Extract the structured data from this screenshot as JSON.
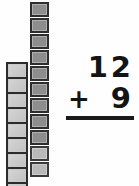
{
  "worksheet": {
    "title": "Base-ten block addition",
    "background_color": "#fefefe"
  },
  "manipulatives": {
    "rod_column": {
      "name": "ten-rod",
      "label": "connected unit rod",
      "cell_count": 9,
      "fill_color": "#c9c9c9",
      "border_color": "#2b2b2b"
    },
    "unit_column": {
      "name": "unit-squares",
      "label": "separate unit cubes",
      "count": 11,
      "fill_color": "#8d8d8d",
      "light_fill_color": "#b9b9b9",
      "border_color": "#2e2e2e",
      "squares": [
        {
          "shade": "dark"
        },
        {
          "shade": "dark"
        },
        {
          "shade": "dark"
        },
        {
          "shade": "dark"
        },
        {
          "shade": "dark"
        },
        {
          "shade": "dark"
        },
        {
          "shade": "dark"
        },
        {
          "shade": "dark"
        },
        {
          "shade": "dark"
        },
        {
          "shade": "light"
        },
        {
          "shade": "light"
        }
      ]
    }
  },
  "problem": {
    "addend_top": "12",
    "operator": "+",
    "addend_bottom": "9",
    "answer": "",
    "rule_color": "#1a1a1a"
  }
}
